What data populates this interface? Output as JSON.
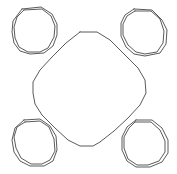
{
  "canvas": {
    "width": 177,
    "height": 174,
    "background": "#ffffff"
  },
  "style": {
    "stroke_color": "#5a5a5a",
    "stroke_width": 1
  },
  "shapes": {
    "center": {
      "kind": "rounded-diamond",
      "points": "80,32 97,32 110,40 125,55 138,68 145,80 146,93 140,105 128,118 114,131 100,142 93,146 80,146 68,140 55,128 42,115 35,104 33,93 33,82 40,70 52,57 66,43 80,32"
    },
    "blobs": [
      {
        "name": "top-left",
        "outer": "22,9 41,7 52,14 57,24 57,35 53,46 44,53 30,54 20,51 14,43 12,32 13,21 22,9",
        "inner": "24,10 42,9 51,16 55,26 54,37 48,48 40,52 28,52 19,47 15,38 14,27 17,17 24,10"
      },
      {
        "name": "top-right",
        "outer": "134,9 152,10 162,20 167,30 166,44 160,53 145,56 134,54 126,47 121,36 121,23 125,15 134,9",
        "inner": "135,11 151,11 160,19 164,31 163,43 157,52 145,54 136,52 128,45 123,35 123,24 127,16 135,11"
      },
      {
        "name": "bottom-left",
        "outer": "24,120 40,119 50,126 56,136 57,150 53,161 44,166 30,166 20,161 14,152 12,140 15,128 24,120",
        "inner": "25,122 40,121 49,127 54,139 55,151 50,160 42,164 31,164 21,158 16,148 14,137 17,127 25,122"
      },
      {
        "name": "bottom-right",
        "outer": "136,120 152,120 162,128 168,140 168,153 162,162 150,167 136,167 127,161 122,150 122,137 127,127 136,120",
        "inner": "135,122 151,122 160,130 165,141 165,152 159,161 148,165 137,165 128,159 124,148 124,137 129,128 135,122"
      }
    ]
  }
}
